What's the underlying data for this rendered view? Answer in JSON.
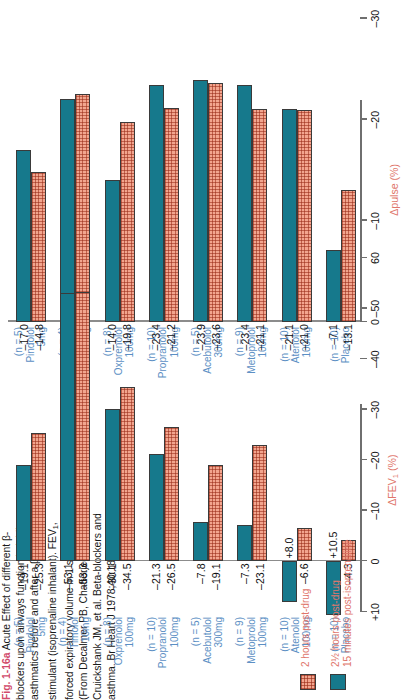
{
  "caption": {
    "fig_label": "Fig. 1-16a",
    "text": " Acute Effect of different β-blockers upon airways function in labile asthmatics before and after a β₂-stimulant (isoprenaline inhalant). FEV₁, forced expiratory volume in 1 second. (From Decalmer PB, Chatterjee SS, Cruickshank JM, et al. Beta-blockers and asthma. Br Heart J 1978;40:184–9.)",
    "label_color": "#d14a6b"
  },
  "legend": {
    "entries": [
      {
        "name": "hatched-swatch",
        "style": "hatch",
        "line1": "2 hours post-drug",
        "line2": ""
      },
      {
        "name": "solid-swatch",
        "style": "solid",
        "line1": "2½ hours post-drug",
        "line2": "15 minutes post-isoprenaline"
      }
    ],
    "color": "#e0766b"
  },
  "colors": {
    "hatched_bar": "#f2a58e",
    "solid_bar": "#16798c",
    "group_label": "#5c8fc4",
    "axis_title": "#e0766b"
  },
  "groups": [
    {
      "n": "(n = 10)",
      "drug": "Placebo",
      "dose": ""
    },
    {
      "n": "(n = 10)",
      "drug": "Atenolol",
      "dose": "100mg"
    },
    {
      "n": "(n = 9)",
      "drug": "Metoprolol",
      "dose": "100mg"
    },
    {
      "n": "(n = 5)",
      "drug": "Acebutolol",
      "dose": "300mg"
    },
    {
      "n": "(n = 10)",
      "drug": "Propranolol",
      "dose": "100mg"
    },
    {
      "n": "(n = 8)",
      "drug": "Oxprenolol",
      "dose": "100mg"
    },
    {
      "n": "(n = 4)",
      "drug": "Timolol",
      "dose": "10mg"
    },
    {
      "n": "(n = 5)",
      "drug": "Pindolol",
      "dose": "5mg"
    }
  ],
  "chart_data": [
    {
      "type": "bar",
      "id": "pulse",
      "title": "",
      "xlabel": "Δpulse (%)",
      "ylabel": "",
      "orientation": "horizontal",
      "xlim": [
        0,
        -35
      ],
      "ticks": [
        0,
        -10,
        -20,
        -30
      ],
      "tick_labels": [
        "0",
        "–10",
        "–20",
        "–30"
      ],
      "grid": false,
      "categories": [
        "Placebo",
        "Atenolol 100mg",
        "Metoprolol 100mg",
        "Acebutolol 300mg",
        "Propranolol 100mg",
        "Oxprenolol 100mg",
        "Timolol 10mg",
        "Pindolol 5mg"
      ],
      "series": [
        {
          "name": "2 hours post-drug",
          "style": "hatch",
          "values": [
            -13.1,
            -21.0,
            -21.1,
            -23.6,
            -21.2,
            -19.8,
            -22.5,
            -14.8
          ],
          "labels": [
            "–13.1",
            "–21.0",
            "–21.1",
            "–23.6",
            "–21.2",
            "–19.8",
            "–22.5",
            "–14.8"
          ]
        },
        {
          "name": "2½ hours post-drug / 15 minutes post-isoprenaline",
          "style": "solid",
          "values": [
            -7.1,
            -21.1,
            -23.4,
            -23.9,
            -23.4,
            -14.0,
            -22.0,
            -17.0
          ],
          "labels": [
            "–7.1",
            "–21.1",
            "–23.4",
            "–23.9",
            "–23.4",
            "–14.0",
            "–22.0",
            "–17.0"
          ]
        }
      ]
    },
    {
      "type": "bar",
      "id": "fev",
      "title": "",
      "xlabel": "ΔFEV₁ (%)",
      "ylabel": "",
      "orientation": "horizontal",
      "xlim": [
        10,
        -60
      ],
      "ticks": [
        10,
        0,
        -10,
        -20,
        -30,
        -40,
        -50,
        -60
      ],
      "tick_labels": [
        "+10",
        "0",
        "–10",
        "–20",
        "–30",
        "–40",
        "–50",
        "60"
      ],
      "grid": false,
      "categories": [
        "Placebo",
        "Atenolol 100mg",
        "Metoprolol 100mg",
        "Acebutolol 300mg",
        "Propranolol 100mg",
        "Oxprenolol 100mg",
        "Timolol 10mg",
        "Pindolol 5mg"
      ],
      "series": [
        {
          "name": "2 hours post-drug",
          "style": "hatch",
          "values": [
            -4.3,
            -6.6,
            -23.1,
            -19.1,
            -26.5,
            -34.5,
            -53.3,
            -25.3
          ],
          "labels": [
            "–4.3",
            "–6.6",
            "–23.1",
            "–19.1",
            "–26.5",
            "–34.5",
            "–53.3",
            "–25.3"
          ]
        },
        {
          "name": "2½ hours post-drug / 15 minutes post-isoprenaline",
          "style": "solid",
          "values": [
            10.5,
            8.0,
            -7.3,
            -7.8,
            -21.3,
            -30.1,
            -53.1,
            -19.1
          ],
          "labels": [
            "+10.5",
            "+8.0",
            "–7.3",
            "–7.8",
            "–21.3",
            "–30.1",
            "–53.1",
            "–19.1"
          ]
        }
      ]
    }
  ]
}
